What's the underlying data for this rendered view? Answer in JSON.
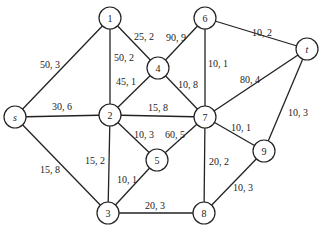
{
  "diagram": {
    "type": "network-flow-graph",
    "node_radius": 11,
    "nodes": [
      {
        "id": "s",
        "label": "s",
        "x": 15,
        "y": 117,
        "italic": true
      },
      {
        "id": "1",
        "label": "1",
        "x": 110,
        "y": 18
      },
      {
        "id": "2",
        "label": "2",
        "x": 110,
        "y": 115
      },
      {
        "id": "3",
        "label": "3",
        "x": 108,
        "y": 213
      },
      {
        "id": "4",
        "label": "4",
        "x": 158,
        "y": 68
      },
      {
        "id": "5",
        "label": "5",
        "x": 157,
        "y": 160
      },
      {
        "id": "6",
        "label": "6",
        "x": 205,
        "y": 18
      },
      {
        "id": "7",
        "label": "7",
        "x": 205,
        "y": 117
      },
      {
        "id": "8",
        "label": "8",
        "x": 204,
        "y": 213
      },
      {
        "id": "9",
        "label": "9",
        "x": 264,
        "y": 151
      },
      {
        "id": "t",
        "label": "t",
        "x": 307,
        "y": 49,
        "italic": true
      }
    ],
    "edges": [
      {
        "from": "s",
        "to": "1",
        "label": "50, 3",
        "lx": 50,
        "ly": 64
      },
      {
        "from": "s",
        "to": "2",
        "label": "30, 6",
        "lx": 62,
        "ly": 106
      },
      {
        "from": "s",
        "to": "3",
        "label": "15, 8",
        "lx": 50,
        "ly": 169
      },
      {
        "from": "1",
        "to": "2",
        "label": "50, 2",
        "lx": 124,
        "ly": 57
      },
      {
        "from": "1",
        "to": "4",
        "label": "25, 2",
        "lx": 144,
        "ly": 36
      },
      {
        "from": "2",
        "to": "4",
        "label": "45, 1",
        "lx": 126,
        "ly": 81
      },
      {
        "from": "2",
        "to": "7",
        "label": "15, 8",
        "lx": 158,
        "ly": 107
      },
      {
        "from": "2",
        "to": "5",
        "label": "10, 3",
        "lx": 144,
        "ly": 134
      },
      {
        "from": "2",
        "to": "3",
        "label": "15, 2",
        "lx": 95,
        "ly": 160
      },
      {
        "from": "3",
        "to": "5",
        "label": "10, 1",
        "lx": 127,
        "ly": 179
      },
      {
        "from": "3",
        "to": "8",
        "label": "20, 3",
        "lx": 155,
        "ly": 205
      },
      {
        "from": "4",
        "to": "6",
        "label": "90, 9",
        "lx": 176,
        "ly": 37
      },
      {
        "from": "4",
        "to": "7",
        "label": "10, 8",
        "lx": 188,
        "ly": 84
      },
      {
        "from": "5",
        "to": "7",
        "label": "60, 5",
        "lx": 175,
        "ly": 134
      },
      {
        "from": "6",
        "to": "7",
        "label": "10, 1",
        "lx": 218,
        "ly": 63
      },
      {
        "from": "6",
        "to": "t",
        "label": "10, 2",
        "lx": 262,
        "ly": 32
      },
      {
        "from": "7",
        "to": "t",
        "label": "80, 4",
        "lx": 250,
        "ly": 79
      },
      {
        "from": "7",
        "to": "9",
        "label": "10, 1",
        "lx": 241,
        "ly": 127
      },
      {
        "from": "7",
        "to": "8",
        "label": "20, 2",
        "lx": 219,
        "ly": 161
      },
      {
        "from": "9",
        "to": "8",
        "label": "10, 3",
        "lx": 243,
        "ly": 187
      },
      {
        "from": "9",
        "to": "t",
        "label": "10, 3",
        "lx": 298,
        "ly": 112
      }
    ]
  }
}
